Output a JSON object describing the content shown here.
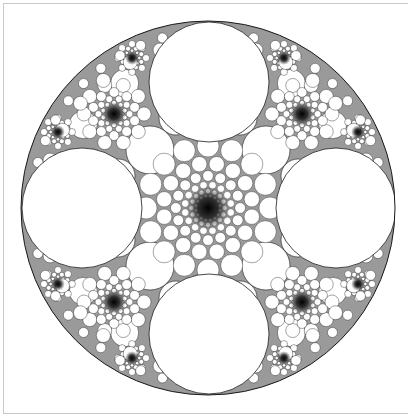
{
  "image": {
    "subject": "circle-packing-fractal",
    "description": "Apollonian-style circle packing fractal inside a large circle with four large white circles and dense dark clusters",
    "colors": {
      "background": "#ffffff",
      "ink": "#1a1a1a",
      "frame": "#c8c8c8"
    },
    "outer_circle": {
      "cx": 208,
      "cy": 208,
      "r": 187
    },
    "large_circles": [
      {
        "cx": 209,
        "cy": 82,
        "r": 60
      },
      {
        "cx": 209,
        "cy": 334,
        "r": 60
      },
      {
        "cx": 82,
        "cy": 208,
        "r": 60
      },
      {
        "cx": 336,
        "cy": 208,
        "r": 60
      }
    ],
    "dark_clusters": [
      {
        "cx": 208,
        "cy": 208,
        "r": 22
      },
      {
        "cx": 114,
        "cy": 114,
        "r": 12
      },
      {
        "cx": 302,
        "cy": 114,
        "r": 12
      },
      {
        "cx": 114,
        "cy": 302,
        "r": 12
      },
      {
        "cx": 302,
        "cy": 302,
        "r": 12
      },
      {
        "cx": 58,
        "cy": 132,
        "r": 7
      },
      {
        "cx": 132,
        "cy": 58,
        "r": 7
      },
      {
        "cx": 284,
        "cy": 58,
        "r": 7
      },
      {
        "cx": 358,
        "cy": 132,
        "r": 7
      },
      {
        "cx": 58,
        "cy": 284,
        "r": 7
      },
      {
        "cx": 132,
        "cy": 358,
        "r": 7
      },
      {
        "cx": 284,
        "cy": 358,
        "r": 7
      },
      {
        "cx": 358,
        "cy": 284,
        "r": 7
      }
    ]
  }
}
